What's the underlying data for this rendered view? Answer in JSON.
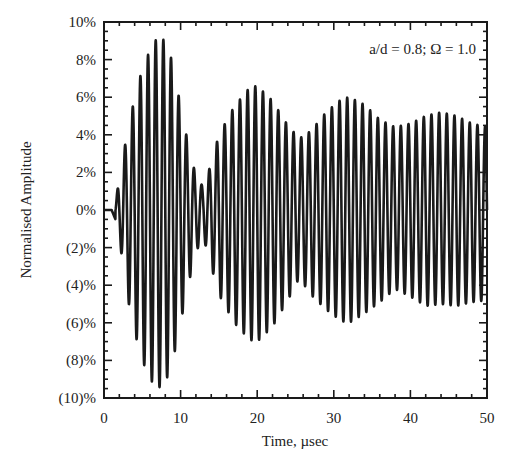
{
  "chart_data": {
    "type": "line",
    "title": "",
    "annotation": "a/d = 0.8; Ω = 1.0",
    "xlabel": "Time, µsec",
    "ylabel": "Normalised Amplitude",
    "xlim": [
      0,
      50
    ],
    "ylim": [
      -10,
      10
    ],
    "x_ticks": [
      0,
      10,
      20,
      30,
      40,
      50
    ],
    "x_tick_labels": [
      "0",
      "10",
      "20",
      "30",
      "40",
      "50"
    ],
    "x_minor_step": 2,
    "y_ticks": [
      10,
      8,
      6,
      4,
      2,
      0,
      -2,
      -4,
      -6,
      -8,
      -10
    ],
    "y_tick_labels": [
      "10%",
      "8%",
      "6%",
      "4%",
      "2%",
      "0%",
      "(2)%",
      "(4)%",
      "(6)%",
      "(8)%",
      "(10)%"
    ],
    "y_minor_step": 0.5,
    "grid": false,
    "legend": null,
    "series": [
      {
        "name": "Normalised Amplitude",
        "color": "#1a1a1a",
        "carrier_period_usec": 1.0,
        "signal_start_usec": 1.5,
        "envelope": {
          "t": [
            0,
            1.5,
            2.0,
            3,
            4,
            5,
            6,
            7,
            8,
            9,
            10,
            11,
            12,
            13,
            14,
            15,
            17,
            19,
            20,
            22,
            24,
            25.5,
            27,
            29,
            31,
            32,
            34,
            36,
            38,
            40,
            42,
            44,
            46,
            48,
            50
          ],
          "pos": [
            0,
            0.3,
            1.8,
            4.0,
            6.0,
            7.5,
            8.5,
            9.2,
            9.0,
            7.8,
            5.5,
            3.5,
            1.8,
            1.2,
            2.5,
            4.0,
            5.5,
            6.5,
            6.6,
            5.8,
            4.5,
            3.8,
            4.2,
            5.2,
            5.9,
            6.0,
            5.6,
            4.8,
            4.4,
            4.6,
            5.0,
            5.2,
            5.0,
            4.6,
            4.4
          ],
          "neg": [
            0,
            0.6,
            1.5,
            4.5,
            6.5,
            8.0,
            9.0,
            9.5,
            9.2,
            8.0,
            6.0,
            4.0,
            2.2,
            1.5,
            3.0,
            4.5,
            6.0,
            6.9,
            7.0,
            6.2,
            4.8,
            3.6,
            4.5,
            5.3,
            5.9,
            6.0,
            5.5,
            4.9,
            4.2,
            4.6,
            5.1,
            5.0,
            5.1,
            4.9,
            4.8
          ]
        }
      }
    ]
  }
}
